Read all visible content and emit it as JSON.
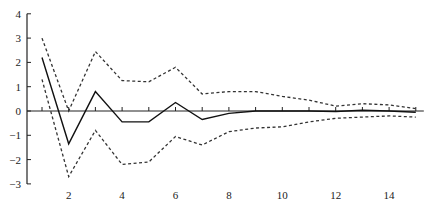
{
  "chart_data": {
    "type": "line",
    "title": "",
    "xlabel": "",
    "ylabel": "",
    "xlim": [
      1,
      15
    ],
    "ylim": [
      -3,
      4
    ],
    "grid": false,
    "legend": null,
    "x": [
      1,
      2,
      3,
      4,
      5,
      6,
      7,
      8,
      9,
      10,
      11,
      12,
      13,
      14,
      15
    ],
    "x_tick_labels": [
      "2",
      "4",
      "6",
      "8",
      "10",
      "12",
      "14"
    ],
    "x_tick_values": [
      2,
      4,
      6,
      8,
      10,
      12,
      14
    ],
    "y_tick_labels": [
      "4",
      "3",
      "2",
      "1",
      "0",
      "-1",
      "-2",
      "-3"
    ],
    "y_tick_values": [
      4,
      3,
      2,
      1,
      0,
      -1,
      -2,
      -3
    ],
    "series": [
      {
        "name": "impulse response",
        "style": "solid",
        "color": "#111111",
        "values": [
          2.2,
          -1.35,
          0.8,
          -0.45,
          -0.45,
          0.35,
          -0.35,
          -0.1,
          0.0,
          0.0,
          0.0,
          -0.02,
          0.03,
          0.0,
          -0.05
        ]
      },
      {
        "name": "upper confidence band",
        "style": "dashed",
        "color": "#333333",
        "values": [
          3.0,
          0.0,
          2.45,
          1.25,
          1.2,
          1.8,
          0.7,
          0.8,
          0.8,
          0.6,
          0.45,
          0.2,
          0.3,
          0.25,
          0.1
        ]
      },
      {
        "name": "lower confidence band",
        "style": "dashed",
        "color": "#333333",
        "values": [
          1.3,
          -2.7,
          -0.8,
          -2.2,
          -2.1,
          -1.05,
          -1.4,
          -0.85,
          -0.7,
          -0.65,
          -0.45,
          -0.3,
          -0.25,
          -0.2,
          -0.25
        ]
      }
    ]
  }
}
